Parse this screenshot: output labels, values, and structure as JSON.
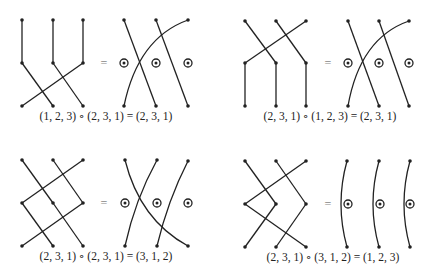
{
  "equals_sign": "=",
  "panels": [
    {
      "caption": "(1, 2, 3) ∘ (2, 3, 1) = (2, 3, 1)",
      "left_composition": [
        "(1, 2, 3)",
        "(2, 3, 1)"
      ],
      "result": "(2, 3, 1)"
    },
    {
      "caption": "(2, 3, 1) ∘ (1, 2, 3) = (2, 3, 1)",
      "left_composition": [
        "(2, 3, 1)",
        "(1, 2, 3)"
      ],
      "result": "(2, 3, 1)"
    },
    {
      "caption": "(2, 3, 1) ∘ (2, 3, 1) = (3, 1, 2)",
      "left_composition": [
        "(2, 3, 1)",
        "(2, 3, 1)"
      ],
      "result": "(3, 1, 2)"
    },
    {
      "caption": "(2, 3, 1) ∘ (3, 1, 2) = (1, 2, 3)",
      "left_composition": [
        "(2, 3, 1)",
        "(3, 1, 2)"
      ],
      "result": "(1, 2, 3)"
    }
  ],
  "colors": {
    "stroke": "#222222",
    "equals": "#888888",
    "background": "#ffffff"
  }
}
